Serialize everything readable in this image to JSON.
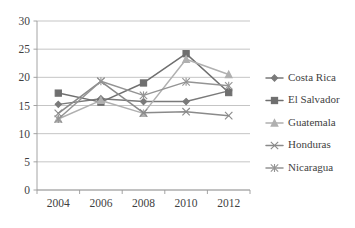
{
  "chart_data": {
    "type": "line",
    "title": "",
    "xlabel": "",
    "ylabel": "",
    "categories": [
      2004,
      2006,
      2008,
      2010,
      2012
    ],
    "x": [
      2004,
      2006,
      2008,
      2010,
      2012
    ],
    "ylim": [
      0,
      30
    ],
    "xlim": [
      2003,
      2013
    ],
    "yticks": [
      0,
      5,
      10,
      15,
      20,
      25,
      30
    ],
    "ytick_labels": [
      "0",
      "5",
      "10",
      "15",
      "20",
      "25",
      "30"
    ],
    "xtick_labels": [
      "2004",
      "2006",
      "2008",
      "2010",
      "2012"
    ],
    "grid": "horizontal",
    "legend_position": "right",
    "series": [
      {
        "name": "Costa Rica",
        "marker": "diamond",
        "color": "#7a7a7a",
        "values": [
          15.2,
          16.2,
          15.7,
          15.7,
          17.6
        ]
      },
      {
        "name": "El Salvador",
        "marker": "square",
        "color": "#6f6f6f",
        "values": [
          17.2,
          15.6,
          19.0,
          24.2,
          17.3
        ]
      },
      {
        "name": "Guatemala",
        "marker": "triangle",
        "color": "#b0b0b0",
        "values": [
          12.6,
          15.9,
          13.6,
          23.2,
          20.5
        ]
      },
      {
        "name": "Honduras",
        "marker": "cross",
        "color": "#8a8a8a",
        "values": [
          13.6,
          19.3,
          13.7,
          13.9,
          13.2
        ]
      },
      {
        "name": "Nicaragua",
        "marker": "asterisk",
        "color": "#949494",
        "values": [
          12.6,
          19.3,
          16.8,
          19.2,
          18.5
        ]
      }
    ]
  },
  "legend": {
    "entries": [
      "Costa Rica",
      "El Salvador",
      "Guatemala",
      "Honduras",
      "Nicaragua"
    ]
  }
}
